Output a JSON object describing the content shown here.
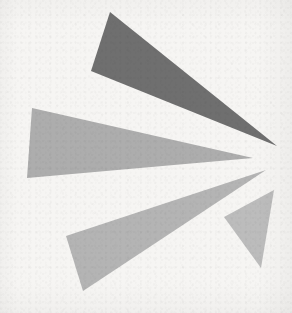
{
  "artwork": {
    "title": "Abstract Triangle Burst",
    "description": "Four elongated gray triangles radiating outward from a common convergence point toward the right-center of the frame",
    "canvas": {
      "width": 292,
      "height": 313
    },
    "background_color": "#f6f5f3",
    "convergence_point": {
      "x": 270,
      "y": 158
    },
    "shapes": [
      {
        "id": "triangle-dark-upper",
        "name": "upper-dark-wedge",
        "fill": "#6f6f6f",
        "points": "110,12 91,71 277,146",
        "vertices": [
          {
            "x": 110,
            "y": 12
          },
          {
            "x": 91,
            "y": 71
          },
          {
            "x": 277,
            "y": 146
          }
        ]
      },
      {
        "id": "triangle-mid-left",
        "name": "middle-gray-wedge",
        "fill": "#adadad",
        "points": "32,108 27,178 253,158",
        "vertices": [
          {
            "x": 32,
            "y": 108
          },
          {
            "x": 27,
            "y": 178
          },
          {
            "x": 253,
            "y": 158
          }
        ]
      },
      {
        "id": "triangle-lower-left",
        "name": "lower-left-gray-wedge",
        "fill": "#b4b4b4",
        "points": "66,236 83,291 266,170",
        "vertices": [
          {
            "x": 66,
            "y": 236
          },
          {
            "x": 83,
            "y": 291
          },
          {
            "x": 266,
            "y": 170
          }
        ]
      },
      {
        "id": "triangle-lower-right",
        "name": "lower-right-gray-wedge",
        "fill": "#bcbcbc",
        "points": "274,190 224,217 261,268",
        "vertices": [
          {
            "x": 274,
            "y": 190
          },
          {
            "x": 224,
            "y": 217
          },
          {
            "x": 261,
            "y": 268
          }
        ]
      }
    ],
    "palette": {
      "darkest_gray": "#6f6f6f",
      "mid_gray": "#adadad",
      "light_gray": "#b4b4b4",
      "lightest_gray": "#bcbcbc",
      "paper": "#f6f5f3"
    }
  }
}
